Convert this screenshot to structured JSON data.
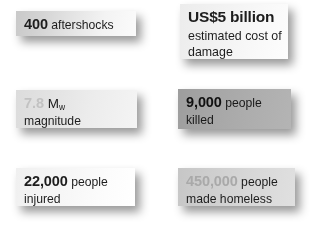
{
  "figure": {
    "kind": "earthquake-statistics-factoid-grid",
    "background_color": "#ffffff",
    "cards": [
      {
        "id": "aftershocks",
        "value": "400",
        "value_muted": false,
        "unit": " aftershocks",
        "sub": "",
        "symbol": "",
        "background": "#d2d2d2"
      },
      {
        "id": "cost",
        "value": "US$5 billion",
        "value_muted": false,
        "unit": "",
        "sub": "estimated cost of\ndamage",
        "sub_line1": "estimated cost of",
        "sub_line2": "damage",
        "symbol": "",
        "background": "#f2f2f2"
      },
      {
        "id": "magnitude",
        "value": "7.8",
        "value_muted": true,
        "unit": "",
        "symbol": "M",
        "symbol_subscript": "w",
        "sub": "magnitude",
        "background": "#e3e3e3"
      },
      {
        "id": "killed",
        "value": "9,000",
        "value_muted": false,
        "unit": " people",
        "sub": "killed",
        "symbol": "",
        "background": "#a6a6a6"
      },
      {
        "id": "injured",
        "value": "22,000",
        "value_muted": false,
        "unit": " people",
        "sub": "injured",
        "symbol": "",
        "background": "#f6f6f6"
      },
      {
        "id": "homeless",
        "value": "450,000",
        "value_muted": true,
        "unit": " people",
        "sub": "made homeless",
        "symbol": "",
        "background": "#cfcfcf"
      }
    ]
  }
}
